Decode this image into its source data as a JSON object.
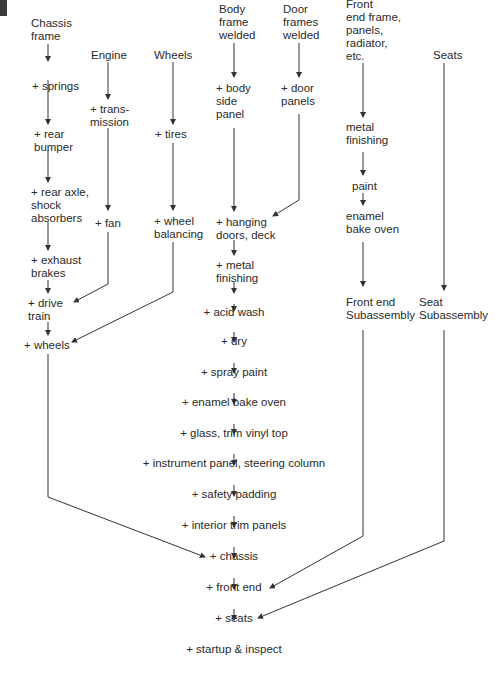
{
  "columns": {
    "chassis": {
      "start": "Chassis\nframe",
      "steps": [
        "+ springs",
        "+ rear\nbumper",
        "+ rear axle,\nshock\nabsorbers",
        "+ exhaust\nbrakes",
        "+ drive\ntrain",
        "+ wheels"
      ]
    },
    "engine": {
      "start": "Engine",
      "steps": [
        "+ trans-\nmission",
        "+ fan"
      ]
    },
    "wheels": {
      "start": "Wheels",
      "steps": [
        "+ tires",
        "+ wheel\nbalancing"
      ]
    },
    "body": {
      "start": "Body\nframe\nwelded",
      "steps": [
        "+ body\nside\npanel"
      ]
    },
    "doors": {
      "start": "Door\nframes\nwelded",
      "steps": [
        "+ door\npanels"
      ]
    },
    "front_end": {
      "start": "Front\nend frame,\npanels,\nradiator,\netc.",
      "steps": [
        "metal\nfinishing",
        "paint",
        "enamel\nbake oven",
        "Front end\nSubassembly"
      ]
    },
    "seats": {
      "start": "Seats",
      "steps": [
        "Seat\nSubassembly"
      ]
    }
  },
  "main_line": [
    "+ hanging\ndoors, deck",
    "+ metal\nfinishing",
    "+ acid wash",
    "+ dry",
    "+ spray paint",
    "+ enamel bake oven",
    "+ glass, trim vinyl top",
    "+ instrument panel, steering column",
    "+ safety padding",
    "+ interior trim panels",
    "+ chassis",
    "+ front end",
    "+ seats",
    "+ startup & inspect"
  ]
}
